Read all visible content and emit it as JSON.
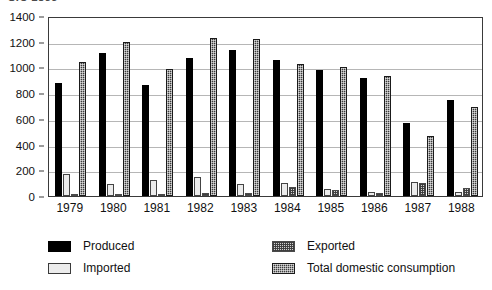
{
  "title_clipped": "SIC 2833",
  "chart_data": {
    "type": "bar",
    "title": "SIC 2833",
    "xlabel": "",
    "ylabel": "",
    "categories": [
      "1979",
      "1980",
      "1981",
      "1982",
      "1983",
      "1984",
      "1985",
      "1986",
      "1987",
      "1988"
    ],
    "ylim": [
      0,
      1400
    ],
    "yticks": [
      0,
      200,
      400,
      600,
      800,
      1000,
      1200,
      1400
    ],
    "grid": true,
    "legend_position": "below",
    "series": [
      {
        "name": "Produced",
        "color": "#000000",
        "values": [
          880,
          1110,
          865,
          1075,
          1135,
          1055,
          980,
          915,
          570,
          750
        ]
      },
      {
        "name": "Imported",
        "color": "#ececec",
        "values": [
          170,
          95,
          125,
          150,
          95,
          105,
          55,
          35,
          110,
          35
        ]
      },
      {
        "name": "Exported",
        "color": "#d2d2d2",
        "values": [
          15,
          10,
          15,
          20,
          20,
          70,
          45,
          20,
          100,
          60
        ]
      },
      {
        "name": "Total domestic consumption",
        "color": "#3c3c3c",
        "values": [
          1045,
          1195,
          985,
          1230,
          1220,
          1025,
          1005,
          935,
          465,
          695
        ]
      }
    ]
  },
  "legend": {
    "entries": [
      {
        "label": "Produced",
        "swatch": "produced"
      },
      {
        "label": "Imported",
        "swatch": "imported"
      },
      {
        "label": "Exported",
        "swatch": "exported"
      },
      {
        "label": "Total domestic consumption",
        "swatch": "consumption"
      }
    ]
  }
}
